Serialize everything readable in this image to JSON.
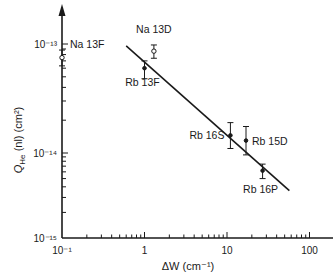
{
  "chart_data": {
    "type": "scatter",
    "title": "",
    "xlabel": "ΔW (cm⁻¹)",
    "ylabel": "Q_He (nl) (cm²)",
    "xscale": "log",
    "yscale": "log",
    "xlim": [
      0.1,
      200
    ],
    "ylim": [
      1e-15,
      2e-13
    ],
    "x_ticks": [
      {
        "value": 0.1,
        "label": "10⁻¹"
      },
      {
        "value": 1,
        "label": "1"
      },
      {
        "value": 10,
        "label": "10"
      },
      {
        "value": 100,
        "label": "100"
      }
    ],
    "y_ticks": [
      {
        "value": 1e-15,
        "label": "10⁻¹⁵"
      },
      {
        "value": 1e-14,
        "label": "10⁻¹⁴"
      },
      {
        "value": 1e-13,
        "label": "10⁻¹³"
      }
    ],
    "grid": false,
    "legend": null,
    "points": [
      {
        "label": "Na 13F",
        "x": 0.1,
        "y": 7.5e-14,
        "y_err_low": 6.3e-14,
        "y_err_high": 8.8e-14,
        "marker": "open-circle"
      },
      {
        "label": "Na 13D",
        "x": 1.3,
        "y": 8.6e-14,
        "y_err_low": 7.4e-14,
        "y_err_high": 9.8e-14,
        "marker": "open-circle"
      },
      {
        "label": "Rb 13F",
        "x": 1.0,
        "y": 6e-14,
        "y_err_low": 4.8e-14,
        "y_err_high": 7e-14,
        "marker": "filled-circle"
      },
      {
        "label": "Rb 16S",
        "x": 11,
        "y": 1.45e-14,
        "y_err_low": 1.1e-14,
        "y_err_high": 1.9e-14,
        "marker": "filled-circle"
      },
      {
        "label": "Rb 15D",
        "x": 17,
        "y": 1.3e-14,
        "y_err_low": 9.5e-15,
        "y_err_high": 1.75e-14,
        "marker": "filled-circle"
      },
      {
        "label": "Rb 16P",
        "x": 27,
        "y": 6.2e-15,
        "y_err_low": 5e-15,
        "y_err_high": 7.4e-15,
        "marker": "filled-circle"
      }
    ],
    "fit_line": {
      "x": [
        0.6,
        57
      ],
      "y": [
        9.6e-14,
        3.6e-15
      ]
    }
  }
}
